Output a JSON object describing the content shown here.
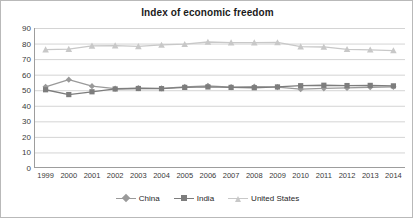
{
  "chart_data": {
    "type": "line",
    "title": "Index of economic freedom",
    "xlabel": "",
    "ylabel": "",
    "ylim": [
      0,
      90
    ],
    "yticks": [
      0,
      10,
      20,
      30,
      40,
      50,
      60,
      70,
      80,
      90
    ],
    "grid": true,
    "legend_position": "bottom",
    "categories": [
      "1999",
      "2000",
      "2001",
      "2002",
      "2003",
      "2004",
      "2005",
      "2006",
      "2007",
      "2008",
      "2009",
      "2010",
      "2011",
      "2012",
      "2013",
      "2014"
    ],
    "series": [
      {
        "name": "China",
        "marker": "diamond",
        "color": "#9a9a9a",
        "values": [
          52.2,
          56.8,
          52.6,
          51.0,
          51.4,
          51.2,
          52.1,
          52.8,
          52.0,
          52.3,
          52.0,
          50.7,
          51.2,
          51.5,
          51.9,
          52.2
        ]
      },
      {
        "name": "India",
        "marker": "square",
        "color": "#7d7d7d",
        "values": [
          50.3,
          47.2,
          49.0,
          50.8,
          51.1,
          51.0,
          51.8,
          52.1,
          51.8,
          51.6,
          52.1,
          52.9,
          53.2,
          53.0,
          53.1,
          52.8
        ]
      },
      {
        "name": "United States",
        "marker": "triangle",
        "color": "#c8c8c8",
        "values": [
          76.1,
          76.4,
          78.5,
          78.7,
          78.2,
          79.1,
          79.6,
          81.0,
          80.6,
          80.6,
          80.7,
          78.0,
          77.8,
          76.3,
          76.0,
          75.5
        ]
      }
    ]
  }
}
